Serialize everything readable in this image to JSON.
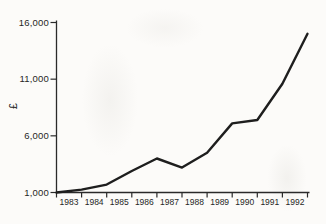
{
  "chart_data": {
    "type": "line",
    "title": "",
    "ylabel": "£",
    "x_categories": [
      "1983",
      "1984",
      "1985",
      "1986",
      "1987",
      "1988",
      "1989",
      "1990",
      "1991",
      "1992"
    ],
    "x_note": "year labels sit between the 11 axis ticks; data points fall on the tick boundaries",
    "values": [
      1000,
      1250,
      1700,
      2900,
      4000,
      3200,
      4500,
      7100,
      7400,
      10600,
      15000
    ],
    "yticks": [
      {
        "value": 1000,
        "label": "1,000"
      },
      {
        "value": 6000,
        "label": "6,000"
      },
      {
        "value": 11000,
        "label": "11,000"
      },
      {
        "value": 16000,
        "label": "16,000"
      }
    ],
    "ylim": [
      1000,
      16000
    ],
    "grid": false,
    "legend": "none",
    "line_color": "#1e1e1e",
    "axis_color": "#2a2a2a",
    "text_color": "#262626",
    "background": "#fcfbf9"
  }
}
